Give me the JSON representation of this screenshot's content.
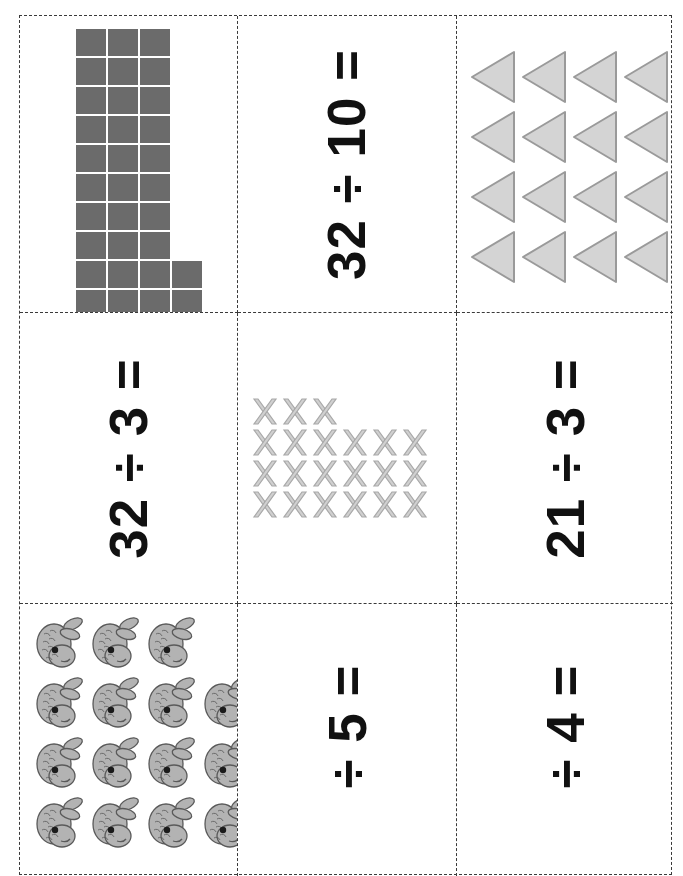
{
  "worksheet": {
    "title": "Division flashcards worksheet",
    "orientation": "rotated-90-ccw",
    "grid": {
      "columns": 3,
      "rows": 3
    },
    "cut_line_style": "dashed",
    "cut_line_color": "#3a3a3a"
  },
  "colors": {
    "square_fill": "#6b6b6b",
    "triangle_fill": "#d4d4d4",
    "triangle_stroke": "#9a9a9a",
    "x_fill": "#d0d0d0",
    "x_stroke": "#a8a8a8",
    "fish_fill": "#b3b3b3",
    "fish_stroke": "#5a5a5a",
    "text": "#111111"
  },
  "cells": [
    {
      "id": "cell-1",
      "kind": "square-array",
      "name": "square-array-32",
      "total": 32,
      "rows": [
        3,
        3,
        3,
        3,
        3,
        3,
        3,
        3,
        4,
        4
      ],
      "columns": 4,
      "equation": ""
    },
    {
      "id": "cell-2",
      "kind": "equation",
      "name": "equation-32-div-10",
      "equation": "32 ÷ 10 ="
    },
    {
      "id": "cell-3",
      "kind": "triangle-array",
      "name": "triangle-array-16",
      "total": 16,
      "rows": [
        4,
        4,
        4,
        4
      ],
      "columns": 4,
      "direction": "left",
      "equation": ""
    },
    {
      "id": "cell-4",
      "kind": "equation",
      "name": "equation-32-div-3",
      "equation": "32 ÷ 3 ="
    },
    {
      "id": "cell-5",
      "kind": "x-array",
      "name": "x-array-21",
      "total": 21,
      "rows": [
        3,
        6,
        6,
        6
      ],
      "columns": 6,
      "equation": ""
    },
    {
      "id": "cell-6",
      "kind": "equation",
      "name": "equation-21-div-3",
      "equation": "21 ÷ 3 ="
    },
    {
      "id": "cell-7",
      "kind": "fish-array",
      "name": "fish-array",
      "rows": [
        3,
        4,
        4,
        4
      ],
      "columns": 4,
      "equation": ""
    },
    {
      "id": "cell-8",
      "kind": "equation",
      "name": "equation-div-5",
      "equation": "÷ 5 ="
    },
    {
      "id": "cell-9",
      "kind": "equation",
      "name": "equation-div-4",
      "equation": "÷ 4 ="
    }
  ]
}
